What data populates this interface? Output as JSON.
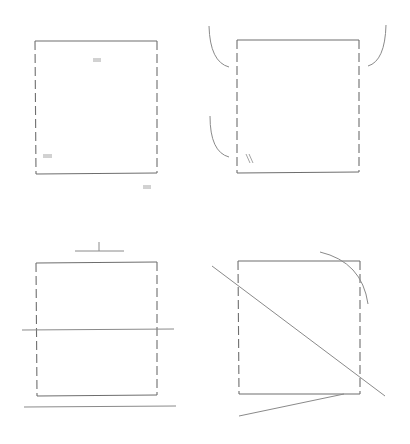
{
  "figure": {
    "colors": {
      "background": "#ffffff",
      "stroke": "#6e6e6e",
      "construction_stroke": "#8a8a8a"
    },
    "panels": [
      {
        "id": "top-left",
        "shape": "rectangle",
        "marks": [
          "equal-length tick (top interior)",
          "equal-length tick (bottom-left interior)",
          "equal-length tick (outside bottom-right)"
        ]
      },
      {
        "id": "top-right",
        "shape": "rectangle",
        "marks": [
          "arc outside upper-left",
          "arc outside upper-right",
          "arc outside lower-left",
          "double slash mark (bottom-left interior)"
        ]
      },
      {
        "id": "bottom-left",
        "shape": "rectangle",
        "marks": [
          "T-shaped perpendicular mark above",
          "horizontal line crossing middle",
          "horizontal line below"
        ]
      },
      {
        "id": "bottom-right",
        "shape": "rectangle",
        "marks": [
          "diagonal line crossing rectangle",
          "arc around top-right corner",
          "slanted line from bottom edge"
        ]
      }
    ]
  }
}
